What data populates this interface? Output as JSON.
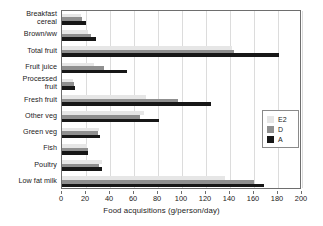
{
  "chart_data": {
    "type": "bar",
    "orientation": "horizontal",
    "title": "",
    "xlabel": "Food acquisitions (g/person/day)",
    "ylabel": "",
    "xlim": [
      0,
      200
    ],
    "xticks": [
      0,
      20,
      40,
      60,
      80,
      100,
      120,
      140,
      160,
      180,
      200
    ],
    "grid": true,
    "legend_position": "right",
    "categories": [
      "Breakfast cereal",
      "Brown/ww",
      "Total fruit",
      "Fruit juice",
      "Processed fruit",
      "Fresh fruit",
      "Other veg",
      "Green veg",
      "Fish",
      "Poultry",
      "Low fat milk"
    ],
    "series": [
      {
        "name": "E2",
        "color": "#e6e6e6",
        "values": [
          16,
          22,
          142,
          27,
          9,
          70,
          68,
          31,
          21,
          33,
          136
        ]
      },
      {
        "name": "D",
        "color": "#8f8f8f",
        "values": [
          17,
          24,
          143,
          35,
          10,
          97,
          65,
          30,
          22,
          31,
          160
        ]
      },
      {
        "name": "A",
        "color": "#171717",
        "values": [
          20,
          28,
          181,
          54,
          11,
          124,
          81,
          32,
          22,
          33,
          168
        ]
      }
    ]
  },
  "axis": {
    "x_title": "Food acquisitions (g/person/day)",
    "tick_labels": [
      "0",
      "20",
      "40",
      "60",
      "80",
      "100",
      "120",
      "140",
      "160",
      "180",
      "200"
    ]
  },
  "legend": {
    "entries": [
      {
        "label": "E2",
        "color": "#e6e6e6"
      },
      {
        "label": "D",
        "color": "#8f8f8f"
      },
      {
        "label": "A",
        "color": "#171717"
      }
    ]
  },
  "category_labels": [
    {
      "line1": "Breakfast",
      "line2": "cereal"
    },
    {
      "line1": "Brown/ww",
      "line2": ""
    },
    {
      "line1": "Total fruit",
      "line2": ""
    },
    {
      "line1": "Fruit juice",
      "line2": ""
    },
    {
      "line1": "Processed",
      "line2": "fruit"
    },
    {
      "line1": "Fresh fruit",
      "line2": ""
    },
    {
      "line1": "Other veg",
      "line2": ""
    },
    {
      "line1": "Green veg",
      "line2": ""
    },
    {
      "line1": "Fish",
      "line2": ""
    },
    {
      "line1": "Poultry",
      "line2": ""
    },
    {
      "line1": "Low fat milk",
      "line2": ""
    }
  ]
}
